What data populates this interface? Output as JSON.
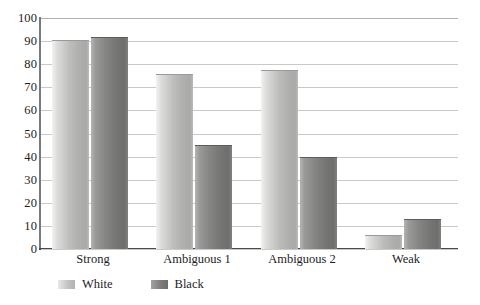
{
  "chart_data": {
    "type": "bar",
    "title": "",
    "subtitle": "",
    "xlabel": "",
    "ylabel": "",
    "categories": [
      "Strong",
      "Ambiguous 1",
      "Ambiguous 2",
      "Weak"
    ],
    "series": [
      {
        "name": "White",
        "values": [
          90,
          75.5,
          77,
          5.5
        ],
        "color": "#bdbdbb"
      },
      {
        "name": "Black",
        "values": [
          91.5,
          44.5,
          39.5,
          12.5
        ],
        "color": "#7b7b79"
      }
    ],
    "ylim": [
      0,
      100
    ],
    "ytick_step": 10,
    "yticks": [
      "100",
      "90",
      "80",
      "70",
      "60",
      "50",
      "40",
      "30",
      "20",
      "10",
      "0"
    ],
    "grid": true,
    "grid_axis": "y",
    "legend_position": "bottom-left",
    "annotations": []
  },
  "legend": {
    "items": [
      {
        "label": "White",
        "swatch": "white-series-swatch"
      },
      {
        "label": "Black",
        "swatch": "black-series-swatch"
      }
    ]
  },
  "colors": {
    "gridline": "#c9c9c9",
    "axis": "#4a4a4a",
    "text": "#1d1d1d",
    "background": "#ffffff"
  }
}
